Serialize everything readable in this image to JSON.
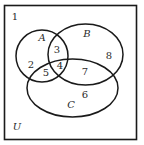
{
  "diagram": {
    "type": "venn",
    "universe_label": "U",
    "sets": [
      {
        "name": "A",
        "shape": "circle"
      },
      {
        "name": "B",
        "shape": "ellipse"
      },
      {
        "name": "C",
        "shape": "ellipse"
      }
    ],
    "regions": [
      {
        "label": "1",
        "membership": "outside A, B, C"
      },
      {
        "label": "2",
        "membership": "A only"
      },
      {
        "label": "3",
        "membership": "A and B, not C"
      },
      {
        "label": "4",
        "membership": "A and B and C"
      },
      {
        "label": "5",
        "membership": "A and C, not B"
      },
      {
        "label": "6",
        "membership": "C only"
      },
      {
        "label": "7",
        "membership": "B and C, not A"
      },
      {
        "label": "8",
        "membership": "B only"
      }
    ],
    "colors": {
      "stroke": "#1a1a1a",
      "text": "#2a2a2a",
      "background": "#ffffff"
    }
  },
  "labels": {
    "set_a": "A",
    "set_b": "B",
    "set_c": "C",
    "universe": "U",
    "r1": "1",
    "r2": "2",
    "r3": "3",
    "r4": "4",
    "r5": "5",
    "r6": "6",
    "r7": "7",
    "r8": "8"
  }
}
